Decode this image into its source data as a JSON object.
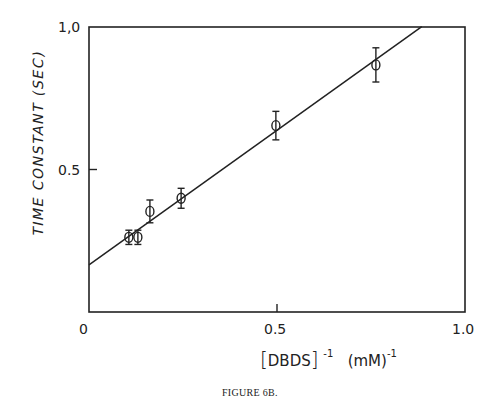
{
  "chart_data": {
    "type": "scatter",
    "title": "",
    "caption": "FIGURE 6B.",
    "xlabel": "[DBDS]⁻¹ (mM)⁻¹",
    "xlabel_parts": {
      "bracket_open": "[",
      "species": "DBDS",
      "bracket_close": "]",
      "exp1": "-1",
      "unit": "(mM)",
      "exp2": "-1"
    },
    "ylabel": "TIME CONSTANT  (SEC)",
    "xlim": [
      0,
      1.0
    ],
    "ylim": [
      0,
      1.0
    ],
    "x_ticks": [
      0,
      0.5,
      1.0
    ],
    "x_tick_labels": [
      "0",
      "0.5",
      "1.0"
    ],
    "y_ticks": [
      0.5,
      1.0
    ],
    "y_tick_labels": [
      "0.5",
      "1,0"
    ],
    "grid": false,
    "legend": null,
    "series": [
      {
        "name": "measured",
        "marker": "open-circle",
        "x": [
          0.106,
          0.13,
          0.162,
          0.245,
          0.497,
          0.763
        ],
        "y": [
          0.262,
          0.262,
          0.353,
          0.399,
          0.654,
          0.867
        ],
        "yerr": [
          0.025,
          0.025,
          0.04,
          0.035,
          0.05,
          0.06
        ]
      }
    ],
    "fit_line": {
      "name": "linear fit",
      "intercept": 0.165,
      "slope": 0.945,
      "x_start": 0,
      "x_end": 0.885
    }
  }
}
